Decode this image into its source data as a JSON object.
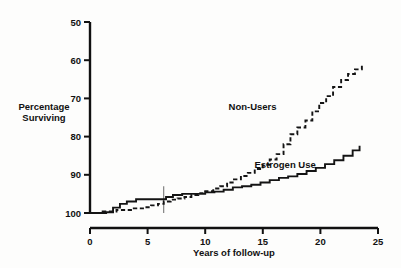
{
  "chart_data": {
    "type": "line",
    "title": "",
    "subtitle": "",
    "xlabel": "Years of follow-up",
    "ylabel": "Percentage Surviving",
    "ylabel_line1": "Percentage",
    "ylabel_line2": "Surviving",
    "xlim": [
      0,
      25
    ],
    "ylim": [
      100,
      50
    ],
    "y_axis_inverted": true,
    "grid": false,
    "legend_position": "inline-annotations",
    "xticks": [
      0,
      5,
      10,
      15,
      20,
      25
    ],
    "xticklabels": [
      "0",
      "5",
      "10",
      "15",
      "20",
      "25"
    ],
    "yticks": [
      50,
      60,
      70,
      80,
      90,
      100
    ],
    "yticklabels": [
      "50",
      "60",
      "70",
      "80",
      "90",
      "100"
    ],
    "annotations": [
      {
        "text": "Non-Users",
        "x": 16.2,
        "y": 73.0
      },
      {
        "text": "Estrogen Use",
        "x": 19.6,
        "y": 88.2
      }
    ],
    "reference_line": {
      "x": 6.4,
      "y_from": 100,
      "y_to": 93.0
    },
    "series": [
      {
        "name": "Non-Users",
        "style": "dashed",
        "step": "post",
        "x": [
          0.0,
          0.6,
          1.1,
          1.6,
          2.3,
          3.0,
          3.8,
          4.6,
          5.3,
          5.9,
          6.4,
          7.0,
          7.6,
          8.2,
          8.8,
          9.4,
          10.0,
          10.7,
          11.3,
          11.9,
          12.5,
          13.1,
          13.7,
          14.3,
          15.0,
          15.6,
          16.2,
          16.8,
          17.4,
          18.0,
          18.7,
          19.3,
          19.9,
          20.5,
          21.1,
          21.8,
          22.4,
          23.0,
          23.6
        ],
        "y": [
          100.0,
          100.0,
          99.6,
          99.6,
          99.2,
          99.2,
          98.8,
          98.5,
          98.0,
          97.6,
          97.0,
          96.5,
          96.2,
          95.8,
          95.3,
          94.8,
          94.3,
          93.6,
          93.0,
          92.0,
          91.2,
          90.3,
          89.5,
          88.5,
          87.4,
          86.0,
          84.6,
          82.0,
          79.4,
          77.6,
          75.8,
          73.4,
          71.2,
          69.4,
          67.0,
          65.2,
          63.6,
          62.4,
          61.2
        ]
      },
      {
        "name": "Estrogen Use",
        "style": "solid",
        "step": "post",
        "x": [
          0.0,
          0.7,
          1.4,
          2.0,
          2.6,
          3.2,
          4.0,
          5.0,
          6.0,
          6.6,
          7.2,
          8.0,
          9.0,
          10.0,
          10.8,
          11.6,
          12.4,
          13.2,
          14.0,
          14.8,
          15.6,
          16.4,
          17.2,
          18.0,
          18.8,
          19.6,
          20.4,
          21.2,
          22.0,
          22.8,
          23.4
        ],
        "y": [
          100.0,
          100.0,
          99.8,
          98.6,
          97.6,
          97.0,
          96.4,
          96.4,
          96.4,
          95.8,
          95.3,
          95.0,
          95.0,
          94.6,
          94.4,
          93.9,
          93.3,
          93.0,
          92.6,
          92.0,
          91.4,
          90.8,
          90.4,
          89.8,
          89.0,
          88.2,
          87.2,
          86.2,
          85.0,
          83.6,
          82.4
        ]
      }
    ]
  }
}
